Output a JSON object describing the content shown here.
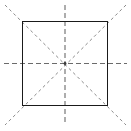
{
  "figure": {
    "canvas": {
      "width": 131,
      "height": 131,
      "background": "#ffffff"
    },
    "shape": {
      "name": "square",
      "stroke_color": "#1a1a1a",
      "stroke_width": 1.6,
      "fill": "none",
      "left": 22.5,
      "top": 21.5,
      "right": 107.5,
      "bottom": 105.5,
      "width": 85,
      "height": 84
    },
    "center": {
      "x": 65,
      "y": 63.5
    },
    "axes": [
      {
        "name": "horizontal-axis",
        "orientation": "horizontal",
        "color": "#6b6b6b",
        "stroke_width": 1.1,
        "dash": "5,3",
        "x1": 4,
        "y1": 63.5,
        "x2": 127,
        "y2": 63.5
      },
      {
        "name": "vertical-axis",
        "orientation": "vertical",
        "color": "#6b6b6b",
        "stroke_width": 1.1,
        "dash": "5,3",
        "x1": 65,
        "y1": 5,
        "x2": 65,
        "y2": 125
      },
      {
        "name": "diagonal-axis-tlbr",
        "orientation": "diagonal-top-left-to-bottom-right",
        "color": "#8a8a8a",
        "stroke_width": 1.0,
        "dash": "3,3",
        "x1": 5,
        "y1": 5,
        "x2": 126,
        "y2": 125
      },
      {
        "name": "diagonal-axis-trbl",
        "orientation": "diagonal-top-right-to-bottom-left",
        "color": "#8a8a8a",
        "stroke_width": 1.0,
        "dash": "3,3",
        "x1": 126,
        "y1": 5,
        "x2": 5,
        "y2": 125
      }
    ],
    "center_dot": {
      "name": "center-point",
      "color": "#3a3a3a",
      "radius": 1.4
    }
  }
}
